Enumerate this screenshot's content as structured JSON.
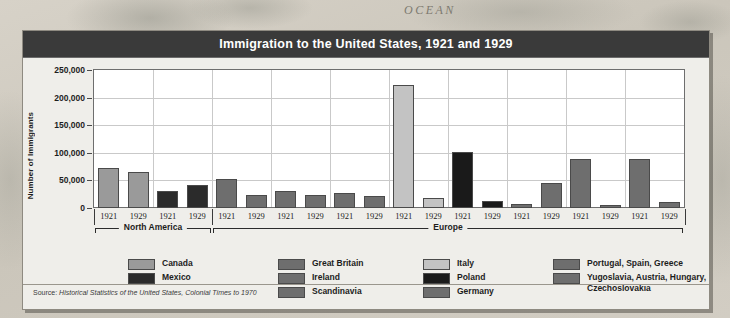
{
  "backdrop": {
    "ocean_label": "OCEAN"
  },
  "chart_card": {
    "title": "Immigration to the United States, 1921 and 1929",
    "ylabel": "Number of Immigrants",
    "source_prefix": "Source: ",
    "source_italic": "Historical Statistics of the United States, Colonial Times to 1970"
  },
  "legend": {
    "columns": [
      {
        "items": [
          {
            "label": "Canada",
            "color": "#9a9a9a"
          },
          {
            "label": "Mexico",
            "color": "#2b2b2b"
          }
        ]
      },
      {
        "items": [
          {
            "label": "Great Britain",
            "color": "#6e6e6e"
          },
          {
            "label": "Ireland",
            "color": "#6e6e6e"
          },
          {
            "label": "Scandinavia",
            "color": "#6e6e6e"
          }
        ]
      },
      {
        "items": [
          {
            "label": "Italy",
            "color": "#c3c3c3"
          },
          {
            "label": "Poland",
            "color": "#1a1a1a"
          },
          {
            "label": "Germany",
            "color": "#6e6e6e"
          }
        ]
      },
      {
        "items": [
          {
            "label": "Portugal, Spain, Greece",
            "color": "#6e6e6e"
          },
          {
            "label": "Yugoslavia, Austria, Hungary,",
            "label2": "Czechoslovakia",
            "color": "#6e6e6e"
          }
        ]
      }
    ]
  },
  "chart_data": {
    "type": "bar",
    "title": "Immigration to the United States, 1921 and 1929",
    "xlabel": "",
    "ylabel": "Number of Immigrants",
    "ylim": [
      0,
      250000
    ],
    "yticks": [
      0,
      50000,
      100000,
      150000,
      200000,
      250000
    ],
    "ytick_labels": [
      "0",
      "50,000",
      "100,000",
      "150,000",
      "200,000",
      "250,000"
    ],
    "grid": true,
    "legend_position": "below",
    "years": [
      "1921",
      "1929"
    ],
    "regions": [
      {
        "name": "North America",
        "categories": [
          "Canada",
          "Mexico"
        ]
      },
      {
        "name": "Europe",
        "categories": [
          "Great Britain",
          "Ireland",
          "Scandinavia",
          "Italy",
          "Poland",
          "Germany",
          "Portugal, Spain, Greece",
          "Yugoslavia, Austria, Hungary, Czechoslovakia"
        ]
      }
    ],
    "categories": [
      "Canada",
      "Mexico",
      "Great Britain",
      "Ireland",
      "Scandinavia",
      "Italy",
      "Poland",
      "Germany",
      "Portugal, Spain, Greece",
      "Yugoslavia, Austria, Hungary, Czechoslovakia"
    ],
    "bars": [
      {
        "category": "Canada",
        "color": "#9a9a9a",
        "region": "North America",
        "values": {
          "1921": 72000,
          "1929": 66000
        }
      },
      {
        "category": "Mexico",
        "color": "#2b2b2b",
        "region": "North America",
        "values": {
          "1921": 31000,
          "1929": 41000
        }
      },
      {
        "category": "Great Britain",
        "color": "#6e6e6e",
        "region": "Europe",
        "values": {
          "1921": 53000,
          "1929": 24000
        }
      },
      {
        "category": "Ireland",
        "color": "#6e6e6e",
        "region": "Europe",
        "values": {
          "1921": 31000,
          "1929": 24000
        }
      },
      {
        "category": "Scandinavia",
        "color": "#6e6e6e",
        "region": "Europe",
        "values": {
          "1921": 27000,
          "1929": 21000
        }
      },
      {
        "category": "Italy",
        "color": "#c3c3c3",
        "region": "Europe",
        "values": {
          "1921": 222000,
          "1929": 18000
        }
      },
      {
        "category": "Poland",
        "color": "#1a1a1a",
        "region": "Europe",
        "values": {
          "1921": 102000,
          "1929": 12000
        }
      },
      {
        "category": "Germany",
        "color": "#6e6e6e",
        "region": "Europe",
        "values": {
          "1921": 7000,
          "1929": 46000
        }
      },
      {
        "category": "Portugal, Spain, Greece",
        "color": "#6e6e6e",
        "region": "Europe",
        "values": {
          "1921": 88000,
          "1929": 5000
        }
      },
      {
        "category": "Yugoslavia, Austria, Hungary, Czechoslovakia",
        "color": "#6e6e6e",
        "region": "Europe",
        "values": {
          "1921": 89000,
          "1929": 10000
        }
      }
    ]
  }
}
